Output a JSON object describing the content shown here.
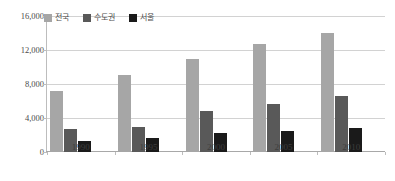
{
  "top_caption": "",
  "chart_data": {
    "type": "bar",
    "title": "",
    "xlabel": "",
    "ylabel": "",
    "categories": [
      "1990",
      "1995",
      "2000",
      "2005",
      "2010"
    ],
    "series": [
      {
        "name": "전국",
        "color": "#a6a6a6",
        "values": [
          7200,
          9100,
          11000,
          12700,
          14000
        ]
      },
      {
        "name": "수도권",
        "color": "#595959",
        "values": [
          2700,
          2900,
          4800,
          5700,
          6600
        ]
      },
      {
        "name": "서울",
        "color": "#1a1a1a",
        "values": [
          1300,
          1700,
          2200,
          2500,
          2800
        ]
      }
    ],
    "ylim": [
      0,
      16000
    ],
    "yticks": [
      0,
      4000,
      8000,
      12000,
      16000
    ],
    "ytick_labels": [
      "0",
      "4,000",
      "8,000",
      "12,000",
      "16,000"
    ],
    "grid": true,
    "legend_position": "top-left"
  }
}
